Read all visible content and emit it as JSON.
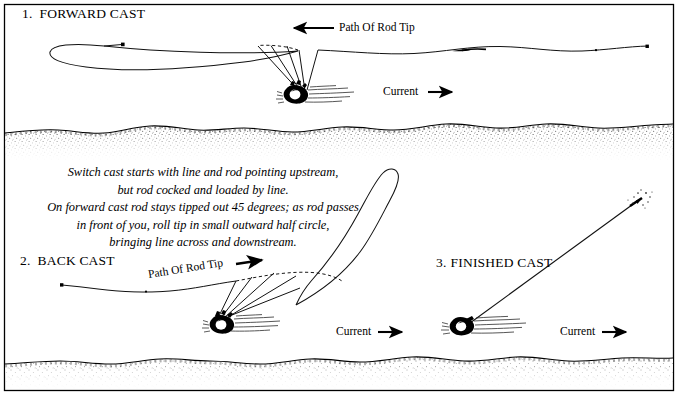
{
  "figure": {
    "border_color": "#000000",
    "background_color": "#ffffff",
    "ink_color": "#000000",
    "width": 678,
    "height": 395
  },
  "panels": [
    {
      "id": "panel-forward-cast",
      "number": "1.",
      "label": "FORWARD CAST",
      "rod_tip_label": "Path Of Rod Tip",
      "current_label": "Current",
      "rod_tip_arrow_direction": "left",
      "current_arrow_direction": "right"
    },
    {
      "id": "panel-back-cast",
      "number": "2.",
      "label": "BACK CAST",
      "rod_tip_label": "Path Of Rod Tip",
      "current_label": "Current",
      "rod_tip_arrow_direction": "right",
      "current_arrow_direction": "right"
    },
    {
      "id": "panel-finished-cast",
      "number": "3.",
      "label": "FINISHED CAST",
      "current_label": "Current",
      "current_arrow_direction": "right"
    }
  ],
  "instructions": {
    "lines": [
      "Switch cast starts with line and rod pointing upstream,",
      "but rod cocked and loaded by line.",
      "On forward cast rod stays tipped out 45 degrees; as rod passes",
      "in front of you, roll tip in small  outward half circle,",
      "bringing line across and downstream."
    ]
  },
  "scene_elements": {
    "riverbank_upper": "stippled-riverbank",
    "riverbank_lower": "stippled-riverbank",
    "angler_figure": "wading-angler-overhead",
    "fly_line": "fly-line",
    "rod_positions": "rod-sweep-lines",
    "rod_tip_path": "dashed-rod-tip-path",
    "landed_fly": "fly-splash"
  }
}
